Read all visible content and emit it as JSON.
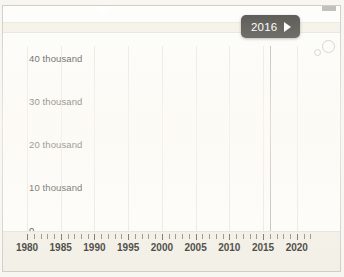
{
  "figure": {
    "tooltip": {
      "year": "2016",
      "play_icon": "play-triangle-icon"
    },
    "decorations": {
      "circle_large": "circle-outline-icon",
      "circle_small": "circle-outline-icon"
    }
  },
  "chart_data": {
    "type": "line",
    "title": "",
    "subtitle": "",
    "xlabel": "",
    "ylabel": "",
    "xlim": [
      1980,
      2023
    ],
    "ylim": [
      0,
      43
    ],
    "grid": true,
    "grid_axis": "x",
    "legend": "none",
    "highlight_x": 2016,
    "y_tick_labels": [
      "0",
      "10 thousand",
      "20 thousand",
      "30 thousand",
      "40 thousand"
    ],
    "y_tick_values": [
      0,
      10000,
      20000,
      30000,
      40000
    ],
    "x_tick_labels": [
      "1980",
      "1985",
      "1990",
      "1995",
      "2000",
      "2005",
      "2010",
      "2015",
      "2020"
    ],
    "x_tick_values": [
      1980,
      1985,
      1990,
      1995,
      2000,
      2005,
      2010,
      2015,
      2020
    ],
    "x_minor_tick_step": 1,
    "units": "thousand",
    "annotations": [
      {
        "label": "2016",
        "type": "year-marker-tooltip",
        "x": 2016
      }
    ],
    "series": [
      {
        "name": "series-1",
        "style": "solid",
        "projection_style": "dotted",
        "projection_from": 2016,
        "x": [
          1980,
          1982,
          1985,
          1988,
          1990,
          1993,
          1995,
          1998,
          2000,
          2002,
          2004,
          2005,
          2006,
          2007,
          2008,
          2009,
          2010,
          2011,
          2012,
          2013,
          2014,
          2015,
          2016,
          2018,
          2020,
          2022,
          2023
        ],
        "values": [
          4200,
          4900,
          5800,
          6900,
          7600,
          8700,
          9500,
          10700,
          11600,
          12700,
          14000,
          14900,
          16100,
          16900,
          16500,
          16600,
          17100,
          17900,
          18700,
          19500,
          20300,
          21100,
          21900,
          25200,
          28400,
          32000,
          33500
        ]
      },
      {
        "name": "series-2",
        "style": "solid",
        "projection_style": "dotted",
        "projection_from": 2016,
        "x": [
          1980,
          1982,
          1985,
          1988,
          1990,
          1993,
          1995,
          1998,
          2000,
          2002,
          2004,
          2005,
          2006,
          2007,
          2008,
          2009,
          2010,
          2011,
          2012,
          2013,
          2014,
          2015,
          2016,
          2018,
          2020,
          2022,
          2023
        ],
        "values": [
          3300,
          3900,
          4800,
          5900,
          6700,
          7900,
          8800,
          10100,
          11100,
          12300,
          13600,
          14300,
          15100,
          15700,
          15500,
          15800,
          16600,
          17500,
          18300,
          19100,
          19900,
          20700,
          21400,
          23000,
          24300,
          25400,
          25800
        ]
      },
      {
        "name": "series-3",
        "style": "solid",
        "projection_style": "dotted",
        "projection_from": 2016,
        "x": [
          1980,
          1982,
          1985,
          1988,
          1990,
          1993,
          1995,
          1998,
          2000,
          2002,
          2004,
          2005,
          2006,
          2007,
          2008,
          2009,
          2010,
          2011,
          2012,
          2013,
          2014,
          2015,
          2016,
          2018,
          2020,
          2022,
          2023
        ],
        "values": [
          1100,
          1300,
          1600,
          1900,
          2100,
          2400,
          2700,
          3200,
          3700,
          4500,
          5900,
          7000,
          8600,
          10200,
          11700,
          13100,
          14400,
          15700,
          16900,
          17900,
          18800,
          19500,
          20100,
          21400,
          22400,
          23200,
          23500
        ]
      },
      {
        "name": "series-4",
        "style": "solid",
        "projection_style": "dotted",
        "projection_from": 2016,
        "x": [
          1980,
          1982,
          1985,
          1988,
          1990,
          1993,
          1995,
          1998,
          2000,
          2002,
          2004,
          2005,
          2006,
          2007,
          2008,
          2009,
          2010,
          2011,
          2012,
          2013,
          2014,
          2015,
          2016,
          2018,
          2020,
          2022,
          2023
        ],
        "values": [
          1150,
          1300,
          1550,
          1850,
          2050,
          2350,
          2600,
          2950,
          3200,
          3450,
          3700,
          3800,
          3950,
          4150,
          4100,
          4250,
          4500,
          4650,
          4800,
          4950,
          5100,
          5250,
          5400,
          5550,
          5650,
          5700,
          5750
        ]
      },
      {
        "name": "series-5",
        "style": "solid",
        "projection_style": "dotted",
        "projection_from": 2016,
        "x": [
          1980,
          1982,
          1985,
          1988,
          1990,
          1993,
          1995,
          1998,
          2000,
          2002,
          2004,
          2005,
          2006,
          2007,
          2008,
          2009,
          2010,
          2011,
          2012,
          2013,
          2014,
          2015,
          2016,
          2018,
          2020,
          2022,
          2023
        ],
        "values": [
          500,
          600,
          750,
          950,
          1100,
          1350,
          1550,
          1850,
          2100,
          2350,
          2600,
          2750,
          2900,
          3050,
          3150,
          3300,
          3450,
          3600,
          3750,
          3900,
          4050,
          4200,
          4350,
          4500,
          4600,
          4650,
          4700
        ]
      }
    ]
  }
}
